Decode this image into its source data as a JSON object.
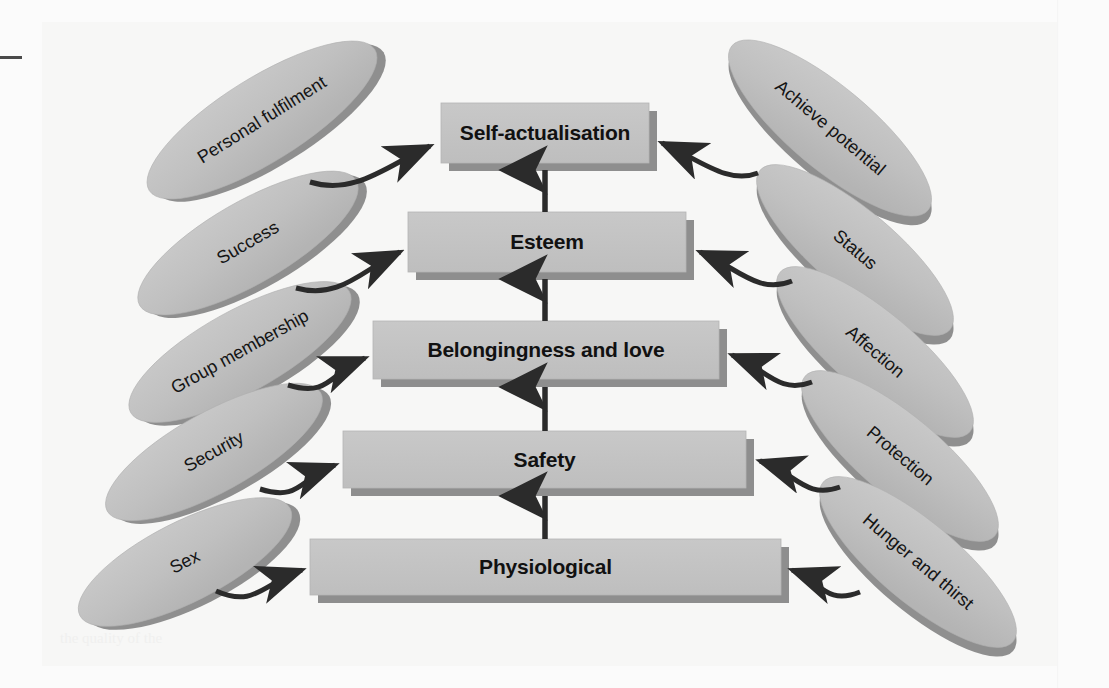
{
  "figure": {
    "background_color": "#f7f7f6",
    "box_fill_color": "#c3c3c3",
    "box_shadow_color": "#8e8e8e",
    "ellipse_fill_color": "#c0c0c0",
    "ellipse_shadow_color": "#8f8f8f",
    "arrow_color": "#2b2b2b",
    "text_color": "#111111"
  },
  "levels": [
    {
      "id": "self-actualisation",
      "label": "Self-actualisation",
      "order": 5,
      "x": 441,
      "y": 103,
      "width": 208,
      "height": 60,
      "font_size": 21
    },
    {
      "id": "esteem",
      "label": "Esteem",
      "order": 4,
      "x": 408,
      "y": 212,
      "width": 278,
      "height": 60,
      "font_size": 21
    },
    {
      "id": "belongingness-and-love",
      "label": "Belongingness and love",
      "order": 3,
      "x": 373,
      "y": 321,
      "width": 346,
      "height": 58,
      "font_size": 21
    },
    {
      "id": "safety",
      "label": "Safety",
      "order": 2,
      "x": 343,
      "y": 431,
      "width": 403,
      "height": 57,
      "font_size": 21
    },
    {
      "id": "physiological",
      "label": "Physiological",
      "order": 1,
      "x": 310,
      "y": 539,
      "width": 471,
      "height": 56,
      "font_size": 21
    }
  ],
  "vertical_arrows": [
    {
      "id": "arrow-esteem-to-self-actualisation",
      "from": "esteem",
      "to": "self-actualisation",
      "x": 545,
      "y_top": 168,
      "y_bottom": 212
    },
    {
      "id": "arrow-belongingness-to-esteem",
      "from": "belongingness-and-love",
      "to": "esteem",
      "x": 545,
      "y_top": 277,
      "y_bottom": 321
    },
    {
      "id": "arrow-safety-to-belongingness",
      "from": "safety",
      "to": "belongingness-and-love",
      "x": 545,
      "y_top": 385,
      "y_bottom": 431
    },
    {
      "id": "arrow-physiological-to-safety",
      "from": "physiological",
      "to": "safety",
      "x": 545,
      "y_top": 494,
      "y_bottom": 539
    }
  ],
  "examples_left": [
    {
      "id": "personal-fulfilment",
      "label": "Personal fulfilment",
      "for_level": "self-actualisation",
      "cx": 262,
      "cy": 120,
      "rx": 133,
      "ry": 42,
      "rotate": -32
    },
    {
      "id": "success",
      "label": "Success",
      "for_level": "esteem",
      "cx": 248,
      "cy": 243,
      "rx": 125,
      "ry": 41,
      "rotate": -30
    },
    {
      "id": "group-membership",
      "label": "Group membership",
      "for_level": "belongingness-and-love",
      "cx": 240,
      "cy": 352,
      "rx": 125,
      "ry": 41,
      "rotate": -29
    },
    {
      "id": "security",
      "label": "Security",
      "for_level": "safety",
      "cx": 214,
      "cy": 452,
      "rx": 122,
      "ry": 40,
      "rotate": -29
    },
    {
      "id": "sex",
      "label": "Sex",
      "for_level": "physiological",
      "cx": 185,
      "cy": 562,
      "rx": 118,
      "ry": 40,
      "rotate": -27
    }
  ],
  "examples_right": [
    {
      "id": "achieve-potential",
      "label": "Achieve potential",
      "for_level": "self-actualisation",
      "cx": 830,
      "cy": 128,
      "rx": 128,
      "ry": 41,
      "rotate": 40
    },
    {
      "id": "status",
      "label": "Status",
      "for_level": "esteem",
      "cx": 855,
      "cy": 250,
      "rx": 124,
      "ry": 40,
      "rotate": 40
    },
    {
      "id": "affection",
      "label": "Affection",
      "for_level": "belongingness-and-love",
      "cx": 875,
      "cy": 352,
      "rx": 124,
      "ry": 40,
      "rotate": 40
    },
    {
      "id": "protection",
      "label": "Protection",
      "for_level": "safety",
      "cx": 900,
      "cy": 456,
      "rx": 124,
      "ry": 40,
      "rotate": 40
    },
    {
      "id": "hunger-and-thirst",
      "label": "Hunger and thirst",
      "for_level": "physiological",
      "cx": 918,
      "cy": 562,
      "rx": 124,
      "ry": 40,
      "rotate": 40
    }
  ],
  "curved_arrows_left": [
    {
      "id": "curve-personal-fulfilment-to-self-actualisation",
      "path": "M 310 182 C 355 196, 388 165, 430 146"
    },
    {
      "id": "curve-success-to-esteem",
      "path": "M 296 288 C 340 300, 362 270, 400 252"
    },
    {
      "id": "curve-group-membership-to-belongingness",
      "path": "M 288 385 C 330 398, 330 372, 365 358"
    },
    {
      "id": "curve-security-to-safety",
      "path": "M 260 489 C 300 502, 300 478, 335 465"
    },
    {
      "id": "curve-sex-to-physiological",
      "path": "M 216 591 C 255 608, 262 584, 302 570"
    }
  ],
  "curved_arrows_right": [
    {
      "id": "curve-achieve-potential-to-self-actualisation",
      "path": "M 758 173 C 728 185, 700 160, 662 143"
    },
    {
      "id": "curve-status-to-esteem",
      "path": "M 792 281 C 758 295, 738 268, 700 252"
    },
    {
      "id": "curve-affection-to-belongingness",
      "path": "M 812 382 C 778 395, 765 368, 732 355"
    },
    {
      "id": "curve-protection-to-safety",
      "path": "M 840 487 C 805 500, 795 472, 760 461"
    },
    {
      "id": "curve-hunger-and-thirst-to-physiological",
      "path": "M 860 592 C 825 606, 820 580, 792 570"
    }
  ],
  "bleed_through_text": [
    "the quality of the"
  ]
}
